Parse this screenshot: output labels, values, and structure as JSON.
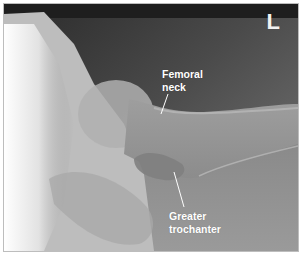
{
  "image": {
    "subject": "Hip radiograph (lateral view)",
    "side_marker": "L",
    "annotations": [
      {
        "label_line1": "Femoral",
        "label_line2": "neck"
      },
      {
        "label_line1": "Greater",
        "label_line2": "trochanter"
      }
    ],
    "colors": {
      "background_dark": "#3a3a3a",
      "bone_light": "#d8d8d8",
      "soft_tissue": "#8a8a8a",
      "label_text": "#ffffff"
    }
  }
}
